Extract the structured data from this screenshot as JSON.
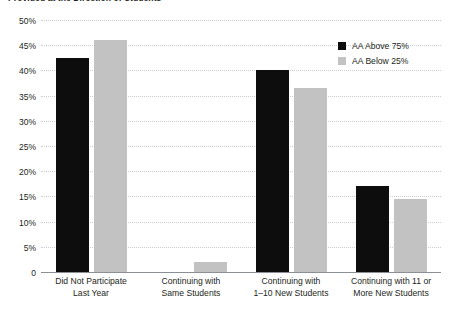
{
  "chart_data": {
    "type": "bar",
    "title": "Provided at the Direction of Students",
    "xlabel": "",
    "ylabel": "",
    "ylim": [
      0,
      50
    ],
    "ytick_labels": [
      "50%",
      "45%",
      "40%",
      "35%",
      "30%",
      "25%",
      "20%",
      "15%",
      "10%",
      "5%",
      "0"
    ],
    "ytick_values": [
      50,
      45,
      40,
      35,
      30,
      25,
      20,
      15,
      10,
      5,
      0
    ],
    "grid": true,
    "legend_position": "top-right",
    "categories": [
      "Did Not Participate Last Year",
      "Continuing with Same Students",
      "Continuing with 1–10 New Students",
      "Continuing with 11 or More New Students"
    ],
    "category_lines": [
      [
        "Did Not Participate",
        "Last Year"
      ],
      [
        "Continuing with",
        "Same Students"
      ],
      [
        "Continuing with",
        "1–10 New Students"
      ],
      [
        "Continuing with 11 or",
        "More New Students"
      ]
    ],
    "series": [
      {
        "name": "AA Above 75%",
        "color": "#0d0d0d",
        "values": [
          42.5,
          0,
          40.0,
          17.0
        ]
      },
      {
        "name": "AA Below 25%",
        "color": "#c2c2c2",
        "values": [
          46.0,
          2.0,
          36.5,
          14.5
        ]
      }
    ]
  },
  "legend": {
    "items": [
      {
        "label": "AA Above 75%"
      },
      {
        "label": "AA Below 25%"
      }
    ]
  }
}
